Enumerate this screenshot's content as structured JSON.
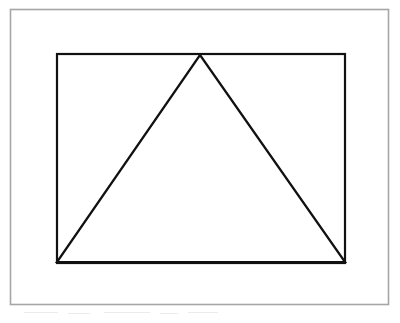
{
  "figure": {
    "background_color": "#ffffff",
    "caption": "",
    "outer_frame": {
      "name": "outer-frame",
      "stroke_color": "#a6a6a6",
      "stroke_width": 1.6,
      "fill_color": "#ffffff",
      "x": 10.5,
      "y": 9.5,
      "width": 378,
      "height": 295
    },
    "shapes": [
      {
        "name": "rectangle",
        "type": "rect",
        "stroke_color": "#111111",
        "stroke_width": 2.2,
        "fill_color": "#ffffff",
        "x": 57,
        "y": 54,
        "width": 288,
        "height": 209,
        "corners": [
          [
            57,
            54
          ],
          [
            345,
            54
          ],
          [
            345,
            263
          ],
          [
            57,
            263
          ]
        ]
      },
      {
        "name": "triangle",
        "type": "polygon",
        "stroke_color": "#111111",
        "stroke_width": 2.2,
        "fill_color": "none",
        "vertices": [
          [
            200,
            55
          ],
          [
            345,
            262
          ],
          [
            57,
            262
          ]
        ],
        "apex": [
          200,
          55
        ],
        "base_left": [
          57,
          262
        ],
        "base_right": [
          345,
          262
        ]
      }
    ],
    "artifacts": [
      {
        "name": "smudge-1",
        "x": 24,
        "y": 312,
        "width": 34
      },
      {
        "name": "smudge-2",
        "x": 68,
        "y": 313,
        "width": 22
      },
      {
        "name": "smudge-3",
        "x": 104,
        "y": 312,
        "width": 46
      },
      {
        "name": "smudge-4",
        "x": 160,
        "y": 313,
        "width": 18
      },
      {
        "name": "smudge-5",
        "x": 188,
        "y": 312,
        "width": 30
      }
    ]
  }
}
